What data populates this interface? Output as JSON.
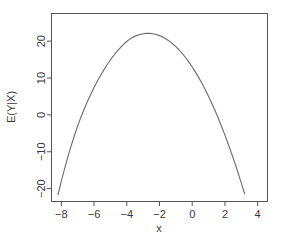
{
  "chart_data": {
    "type": "line",
    "title": "",
    "subtitle": "",
    "xlabel": "x",
    "ylabel": "E(Y|X)",
    "xlim": [
      -8.6,
      4.6
    ],
    "ylim": [
      -23.5,
      27.5
    ],
    "grid": false,
    "legend": null,
    "xticks": [
      -8,
      -6,
      -4,
      -2,
      0,
      2,
      4
    ],
    "xtick_labels": [
      "-8",
      "-6",
      "-4",
      "-2",
      "0",
      "2",
      "4"
    ],
    "yticks": [
      -20,
      -10,
      0,
      10,
      20
    ],
    "ytick_labels": [
      "-20",
      "-10",
      "0",
      "10",
      "20"
    ],
    "line_color": "#6b6b6b",
    "axis_color": "#555555",
    "line_width": 1.1,
    "series": [
      {
        "name": "E(Y|X)",
        "x": [
          -8.2,
          -8.0,
          -7.8,
          -7.6,
          -7.4,
          -7.2,
          -7.0,
          -6.8,
          -6.6,
          -6.4,
          -6.2,
          -6.0,
          -5.8,
          -5.6,
          -5.4,
          -5.2,
          -5.0,
          -4.8,
          -4.6,
          -4.4,
          -4.2,
          -4.0,
          -3.8,
          -3.6,
          -3.4,
          -3.2,
          -3.0,
          -2.8,
          -2.6,
          -2.4,
          -2.2,
          -2.0,
          -1.8,
          -1.6,
          -1.4,
          -1.2,
          -1.0,
          -0.8,
          -0.6,
          -0.4,
          -0.2,
          0.0,
          0.2,
          0.4,
          0.6,
          0.8,
          1.0,
          1.2,
          1.4,
          1.6,
          1.8,
          2.0,
          2.2,
          2.4,
          2.6,
          2.8,
          3.0,
          3.2,
          3.4,
          3.6,
          3.8,
          4.0,
          4.2
        ],
        "y": [
          -21.6,
          -18.0,
          -14.6,
          -11.4,
          -8.4,
          -5.6,
          -3.0,
          -0.6,
          1.6,
          3.7,
          5.6,
          7.4,
          9.1,
          10.7,
          12.2,
          13.6,
          14.9,
          16.1,
          17.2,
          18.2,
          19.1,
          19.9,
          20.6,
          21.1,
          21.5,
          21.8,
          22.0,
          22.1,
          22.1,
          22.0,
          21.8,
          21.5,
          21.1,
          20.6,
          20.0,
          19.3,
          18.5,
          17.6,
          16.6,
          15.5,
          14.3,
          13.0,
          11.6,
          10.1,
          8.5,
          6.8,
          5.0,
          3.1,
          1.1,
          -1.0,
          -3.2,
          -5.5,
          -7.9,
          -10.4,
          -13.0,
          -15.7,
          -18.5,
          -21.4,
          -24.4,
          -27.5,
          -30.7,
          -34.0,
          -37.4
        ]
      }
    ],
    "annotations": {
      "peak_value": 22.5,
      "peak_x": -4.5,
      "minimum_value": -11.0,
      "minimum_x": 1.0
    }
  },
  "figure": {
    "background": "#ffffff",
    "plot_box_border": true
  }
}
